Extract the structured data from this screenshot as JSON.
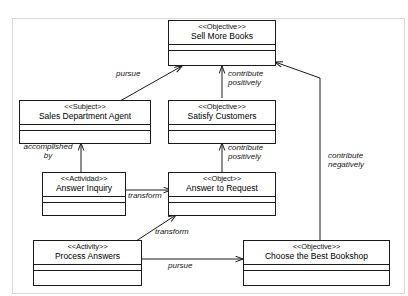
{
  "diagram": {
    "nodes": [
      {
        "id": "sell-more-books",
        "stereotype": "<<Objective>>",
        "name": "Sell More Books"
      },
      {
        "id": "sales-department-agent",
        "stereotype": "<<Subject>>",
        "name": "Sales Department Agent"
      },
      {
        "id": "satisfy-customers",
        "stereotype": "<<Objective>>",
        "name": "Satisfy Customers"
      },
      {
        "id": "answer-inquiry",
        "stereotype": "<<Actividad>>",
        "name": "Answer Inquiry"
      },
      {
        "id": "answer-to-request",
        "stereotype": "<<Object>>",
        "name": "Answer to Request"
      },
      {
        "id": "process-answers",
        "stereotype": "<<Activity>>",
        "name": "Process Answers"
      },
      {
        "id": "choose-the-best-bookshop",
        "stereotype": "<<Objective>>",
        "name": "Choose the Best Bookshop"
      }
    ],
    "edges": [
      {
        "id": "pursue-top",
        "label": "pursue",
        "from": "sales-department-agent",
        "to": "sell-more-books"
      },
      {
        "id": "contribute-positively-top",
        "label_line1": "contribute",
        "label_line2": "positively",
        "from": "satisfy-customers",
        "to": "sell-more-books"
      },
      {
        "id": "accomplished-by",
        "label_line1": "accomplished",
        "label_line2": "by",
        "from": "answer-inquiry",
        "to": "sales-department-agent"
      },
      {
        "id": "contribute-positively-mid",
        "label_line1": "contribute",
        "label_line2": "positively",
        "from": "answer-to-request",
        "to": "satisfy-customers"
      },
      {
        "id": "contribute-negatively",
        "label_line1": "contribute",
        "label_line2": "negatively",
        "from": "choose-the-best-bookshop",
        "to": "sell-more-books"
      },
      {
        "id": "transform-upper",
        "label": "transform",
        "from": "answer-inquiry",
        "to": "answer-to-request"
      },
      {
        "id": "transform-lower",
        "label": "transform",
        "from": "process-answers",
        "to": "answer-to-request"
      },
      {
        "id": "pursue-bottom",
        "label": "pursue",
        "from": "process-answers",
        "to": "choose-the-best-bookshop"
      }
    ]
  },
  "colors": {
    "stroke": "#1a1a1a",
    "frame": "#d8d8d8",
    "background": "#ffffff"
  }
}
